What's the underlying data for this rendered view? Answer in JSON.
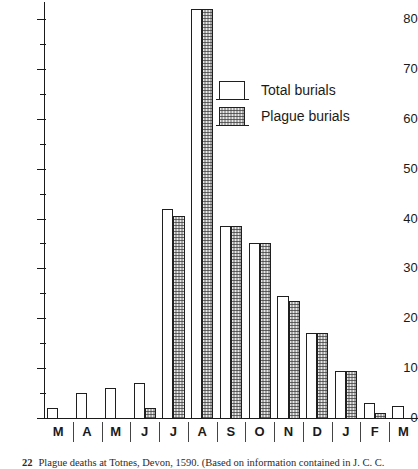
{
  "chart_data": {
    "type": "bar",
    "title": "",
    "xlabel": "",
    "ylabel": "",
    "ylim": [
      0,
      85
    ],
    "y_ticks_major": [
      0,
      10,
      20,
      30,
      40,
      50,
      60,
      70,
      80
    ],
    "y_ticks_minor": [
      5,
      15,
      25,
      35,
      45,
      55,
      65,
      75
    ],
    "grid": false,
    "legend_position": "upper-center-right",
    "categories": [
      "M",
      "A",
      "M",
      "J",
      "J",
      "A",
      "S",
      "O",
      "N",
      "D",
      "J",
      "F",
      "M"
    ],
    "series": [
      {
        "name": "Total burials",
        "values": [
          2,
          5,
          6,
          7,
          42,
          82,
          38.5,
          35,
          24.5,
          17,
          9.5,
          3,
          2.5
        ]
      },
      {
        "name": "Plague burials",
        "values": [
          0,
          0,
          0,
          2,
          40.5,
          82,
          38.5,
          35,
          23.5,
          17,
          9.5,
          1,
          0
        ]
      }
    ]
  },
  "legend": {
    "items": [
      {
        "label": "Total burials",
        "swatch": "open"
      },
      {
        "label": "Plague burials",
        "swatch": "stippled"
      }
    ]
  },
  "caption": {
    "number": "22",
    "text": "Plague deaths at Totnes, Devon, 1590. (Based on information contained in J. C. C."
  },
  "colors": {
    "axis": "#1a1a1a",
    "bar_outline": "#1f1f1f",
    "total_fill": "#ffffff",
    "plague_fill": "#e8e8e8",
    "background": "#ffffff"
  }
}
